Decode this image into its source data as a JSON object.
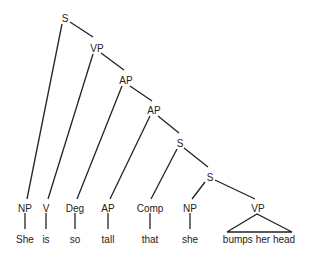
{
  "diagram": {
    "type": "syntax-tree",
    "nodes": {
      "s_root": {
        "label": "S",
        "x": 65,
        "y": 18
      },
      "vp_top": {
        "label": "VP",
        "x": 97,
        "y": 48
      },
      "ap_1": {
        "label": "AP",
        "x": 126,
        "y": 80
      },
      "ap_2": {
        "label": "AP",
        "x": 154,
        "y": 110
      },
      "s_2": {
        "label": "S",
        "x": 180,
        "y": 143
      },
      "s_3": {
        "label": "S",
        "x": 210,
        "y": 177
      },
      "np_she": {
        "label": "NP",
        "x": 25,
        "y": 209
      },
      "v_is": {
        "label": "V",
        "x": 46,
        "y": 209
      },
      "deg_so": {
        "label": "Deg",
        "x": 75,
        "y": 209
      },
      "ap_tall": {
        "label": "AP",
        "x": 108,
        "y": 209
      },
      "comp_that": {
        "label": "Comp",
        "x": 150,
        "y": 209
      },
      "np_she2": {
        "label": "NP",
        "x": 190,
        "y": 209
      },
      "vp_bumps": {
        "label": "VP",
        "x": 258,
        "y": 209
      }
    },
    "words": {
      "w1": "She",
      "w2": "is",
      "w3": "so",
      "w4": "tall",
      "w5": "that",
      "w6": "she",
      "w7": "bumps her head"
    }
  }
}
